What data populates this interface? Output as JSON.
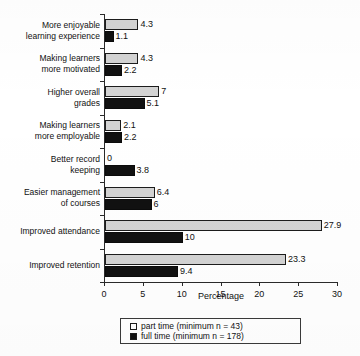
{
  "chart_data": {
    "type": "bar",
    "orientation": "horizontal",
    "title": "",
    "xlabel": "Percentage",
    "ylabel": "",
    "xlim": [
      0,
      30
    ],
    "xticks": [
      0,
      5,
      10,
      15,
      20,
      25,
      30
    ],
    "xtick_labels": [
      "0",
      "5",
      "10",
      "15",
      "20",
      "25",
      "30"
    ],
    "grid": false,
    "legend_position": "bottom",
    "categories": [
      "More enjoyable learning experience",
      "Making learners more motivated",
      "Higher overall grades",
      "Making learners more employable",
      "Better record keeping",
      "Easier management of courses",
      "Improved attendance",
      "Improved retention"
    ],
    "category_lines": [
      [
        "More enjoyable",
        "learning experience"
      ],
      [
        "Making learners",
        "more motivated"
      ],
      [
        "Higher overall",
        "grades"
      ],
      [
        "Making learners",
        "more employable"
      ],
      [
        "Better record",
        "keeping"
      ],
      [
        "Easier management",
        "of courses"
      ],
      [
        "Improved attendance"
      ],
      [
        "Improved retention"
      ]
    ],
    "series": [
      {
        "name": "part time (minimum n = 43)",
        "short_name": "part time",
        "color": "#d3d3d3",
        "values": [
          4.3,
          4.3,
          7,
          2.1,
          0,
          6.4,
          27.9,
          23.3
        ],
        "value_labels": [
          "4.3",
          "4.3",
          "7",
          "2.1",
          "0",
          "6.4",
          "27.9",
          "23.3"
        ]
      },
      {
        "name": "full time (minimum n = 178)",
        "short_name": "full time",
        "color": "#111111",
        "values": [
          1.1,
          2.2,
          5.1,
          2.2,
          3.8,
          6,
          10,
          9.4
        ],
        "value_labels": [
          "1.1",
          "2.2",
          "5.1",
          "2.2",
          "3.8",
          "6",
          "10",
          "9.4"
        ]
      }
    ]
  },
  "legend": {
    "entries": [
      {
        "label": "part time (minimum n = 43)",
        "swatch": "open-square"
      },
      {
        "label": "full time (minimum n = 178)",
        "swatch": "filled-square"
      }
    ]
  },
  "axis": {
    "x_title": "Percentage"
  }
}
